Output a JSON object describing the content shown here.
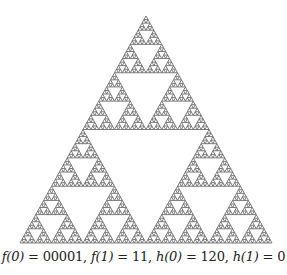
{
  "figure": {
    "type": "sierpinski-triangle",
    "apex": [
      146,
      16
    ],
    "bottom_left": [
      20,
      243
    ],
    "bottom_right": [
      272,
      243
    ],
    "depth": 6,
    "fill_color": "#6e6e6e",
    "background": "#ffffff"
  },
  "caption": {
    "text": "f(0) = 00001, f(1) = 11, h(0) = 120, h(1) = 0",
    "parts": {
      "f0_label": "f(0)",
      "f0_value": "00001",
      "f1_label": "f(1)",
      "f1_value": "11",
      "h0_label": "h(0)",
      "h0_value": "120",
      "h1_label": "h(1)",
      "h1_value": "0"
    }
  }
}
